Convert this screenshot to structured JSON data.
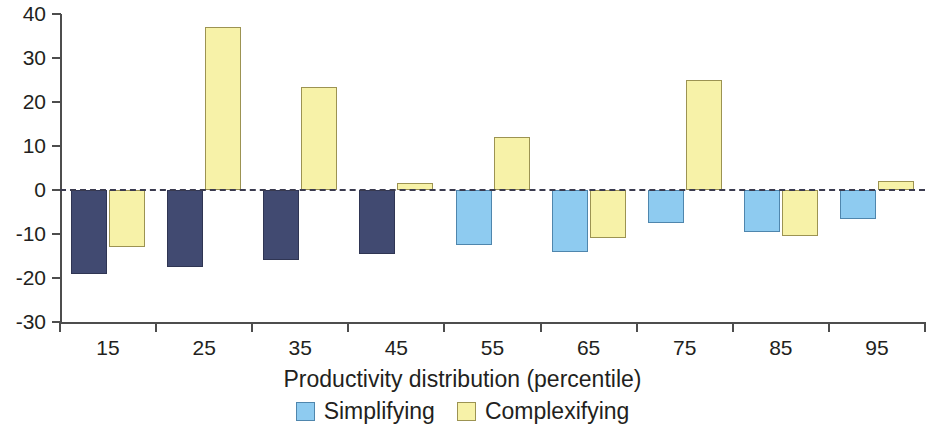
{
  "chart_data": {
    "type": "bar",
    "title": "",
    "xlabel": "Productivity distribution (percentile)",
    "ylabel": "",
    "categories": [
      "15",
      "25",
      "35",
      "45",
      "55",
      "65",
      "75",
      "85",
      "95"
    ],
    "series": [
      {
        "name": "Simplifying",
        "color": "#8ecbf0",
        "values": [
          -19,
          -17.5,
          -16,
          -14.5,
          -12.5,
          -14,
          -7.5,
          -9.5,
          -6.5
        ]
      },
      {
        "name": "Complexifying",
        "color": "#f7f2a8",
        "values": [
          -13,
          37,
          23.5,
          1.5,
          12,
          -11,
          25,
          -10.5,
          2
        ]
      }
    ],
    "ylim": [
      -30,
      40
    ],
    "yticks": [
      40,
      30,
      20,
      10,
      0,
      -10,
      -20,
      -30
    ],
    "ytick_labels": [
      "40",
      "30",
      "20",
      "10",
      "0",
      "-10",
      "-20",
      "-30"
    ],
    "grid": false,
    "zero_line": true,
    "zero_line_style": "dashed",
    "legend_position": "bottom-center"
  },
  "legend": {
    "items": [
      {
        "label": "Simplifying",
        "swatch": "simplifying"
      },
      {
        "label": "Complexifying",
        "swatch": "complexifying"
      }
    ]
  },
  "axis": {
    "x_title": "Productivity distribution (percentile)"
  }
}
